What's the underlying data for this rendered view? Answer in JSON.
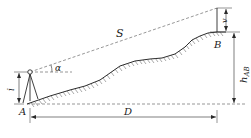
{
  "diagram": {
    "labels": {
      "S": "S",
      "alpha": "α",
      "i": "i",
      "A": "A",
      "B": "B",
      "D": "D",
      "v": "v",
      "h": "h",
      "h_sub": "AB"
    },
    "colors": {
      "line": "#2a2a2a",
      "dashed": "#6a6a6a",
      "hatch": "#555555",
      "background": "#ffffff"
    }
  }
}
